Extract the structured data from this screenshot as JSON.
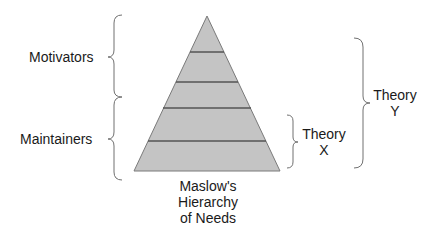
{
  "diagram": {
    "pyramid": {
      "name": "Maslow's Hierarchy of Needs",
      "caption_lines": [
        "Maslow's",
        "Hierarchy",
        "of Needs"
      ],
      "layer_count": 5,
      "fill": "#c4c4c4",
      "stroke": "#555555"
    },
    "left_labels": {
      "motivators": "Motivators",
      "maintainers": "Maintainers"
    },
    "right_labels": {
      "theory_x": [
        "Theory",
        "X"
      ],
      "theory_y": [
        "Theory",
        "Y"
      ]
    },
    "brace_color": "#707070"
  }
}
